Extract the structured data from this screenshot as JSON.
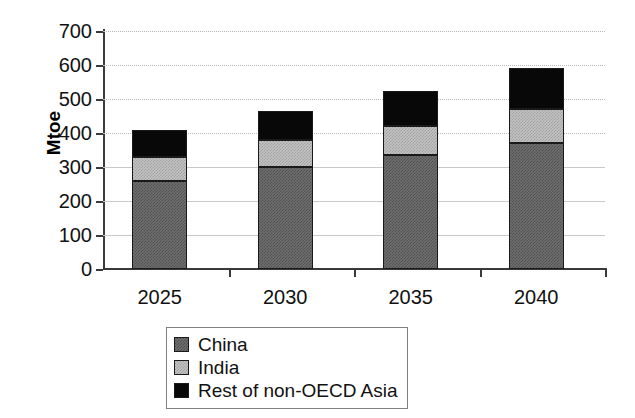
{
  "chart_data": {
    "type": "bar",
    "subtype": "stacked-vertical",
    "title": "",
    "xlabel": "",
    "ylabel": "Mtoe",
    "categories": [
      "2025",
      "2030",
      "2035",
      "2040"
    ],
    "series": [
      {
        "name": "China",
        "color": "#6e6e6e",
        "values": [
          260,
          300,
          335,
          370
        ]
      },
      {
        "name": "India",
        "color": "#c2c2c2",
        "values": [
          70,
          80,
          85,
          100
        ]
      },
      {
        "name": "Rest of non-OECD Asia",
        "color": "#080808",
        "values": [
          80,
          85,
          105,
          120
        ]
      }
    ],
    "totals": [
      410,
      465,
      525,
      590
    ],
    "ylim": [
      0,
      700
    ],
    "ytick_step": 100,
    "yticks": [
      0,
      100,
      200,
      300,
      400,
      500,
      600,
      700
    ],
    "ytick_labels": [
      "0",
      "100",
      "200",
      "300",
      "400",
      "500",
      "600",
      "700"
    ],
    "grid": true,
    "grid_axis": "y",
    "legend_position": "bottom-left",
    "legend_boxed": true
  },
  "axes": {
    "y_title": "Mtoe",
    "y_tick_labels": [
      "700",
      "600",
      "500",
      "400",
      "300",
      "200",
      "100",
      "0"
    ],
    "x_tick_labels": [
      "2025",
      "2030",
      "2035",
      "2040"
    ]
  },
  "legend": {
    "items": [
      {
        "label": "China",
        "swatch": "china-swatch"
      },
      {
        "label": "India",
        "swatch": "india-swatch"
      },
      {
        "label": "Rest of non-OECD Asia",
        "swatch": "rest-swatch"
      }
    ]
  }
}
